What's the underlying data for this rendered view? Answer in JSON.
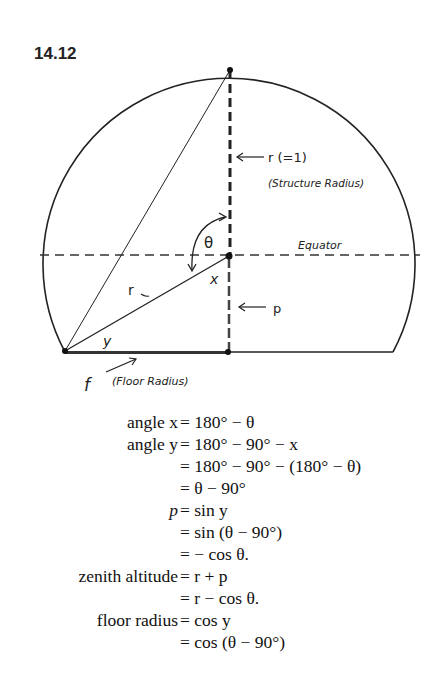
{
  "figure_number": "14.12",
  "diagram": {
    "labels": {
      "r_top": "r  (=1)",
      "structure_radius": "(Structure Radius)",
      "theta": "θ",
      "equator": "Equator",
      "x": "x",
      "r_diag": "r",
      "p": "p",
      "y": "y",
      "f": "f",
      "floor_radius": "(Floor Radius)"
    }
  },
  "equations": [
    {
      "lhs": "angle x",
      "rhs": "= 180° − θ"
    },
    {
      "lhs": "angle y",
      "rhs": "= 180° − 90° − x"
    },
    {
      "lhs": "",
      "rhs": "= 180° − 90° − (180° − θ)"
    },
    {
      "lhs": "",
      "rhs": "= θ − 90°"
    },
    {
      "lhs": "p",
      "rhs": "= sin y"
    },
    {
      "lhs": "",
      "rhs": "= sin (θ − 90°)"
    },
    {
      "lhs": "",
      "rhs": "= − cos θ."
    },
    {
      "lhs": "zenith altitude",
      "rhs": "= r + p"
    },
    {
      "lhs": "",
      "rhs": "= r − cos θ."
    },
    {
      "lhs": "floor radius",
      "rhs": "= cos y"
    },
    {
      "lhs": "",
      "rhs": "= cos (θ − 90°)"
    }
  ]
}
